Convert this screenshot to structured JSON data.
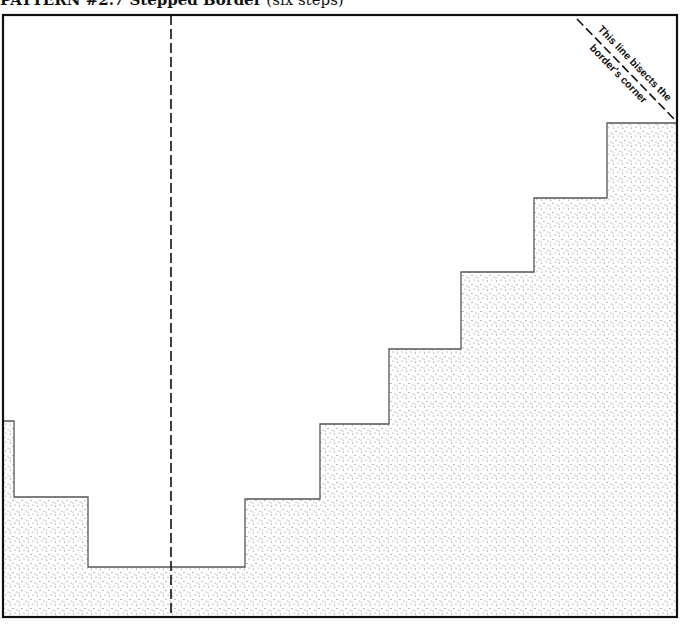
{
  "figure": {
    "title_bold": "PATTERN #2.7  Stepped Border",
    "title_paren": " (six steps)",
    "annotation_line1": "This line bisects the",
    "annotation_line2": "border's corner",
    "colors": {
      "stroke": "#111111",
      "step_edge": "#555555",
      "fill_dots": "#6a6a6a",
      "background": "#ffffff"
    },
    "frame": {
      "x1": 3,
      "y1": 15,
      "x2": 677,
      "y2": 617
    },
    "center_guide_x": 171,
    "diagonal": {
      "x1": 577,
      "y1": 19,
      "x2": 677,
      "y2": 122
    },
    "step_profile": [
      [
        3,
        421
      ],
      [
        14,
        421
      ],
      [
        14,
        497
      ],
      [
        88,
        497
      ],
      [
        88,
        567
      ],
      [
        245,
        567
      ],
      [
        245,
        499
      ],
      [
        320,
        499
      ],
      [
        320,
        424
      ],
      [
        389,
        424
      ],
      [
        389,
        349
      ],
      [
        461,
        349
      ],
      [
        461,
        272
      ],
      [
        534,
        272
      ],
      [
        534,
        198
      ],
      [
        607,
        198
      ],
      [
        607,
        123
      ],
      [
        677,
        123
      ]
    ]
  }
}
